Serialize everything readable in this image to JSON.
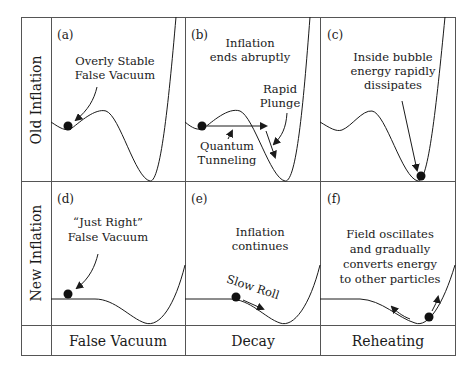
{
  "figure": {
    "rows": [
      {
        "label": "Old Inflation"
      },
      {
        "label": "New Inflation"
      }
    ],
    "columns": [
      {
        "label": "False Vacuum"
      },
      {
        "label": "Decay"
      },
      {
        "label": "Reheating"
      }
    ],
    "panels": {
      "a": {
        "tag": "(a)",
        "lines": [
          "Overly Stable",
          "False Vacuum"
        ]
      },
      "b": {
        "tag": "(b)",
        "lines": [
          "Inflation",
          "ends abruptly"
        ],
        "label_plunge": [
          "Rapid",
          "Plunge"
        ],
        "label_tunnel": [
          "Quantum",
          "Tunneling"
        ]
      },
      "c": {
        "tag": "(c)",
        "lines": [
          "Inside bubble",
          "energy rapidly",
          "dissipates"
        ]
      },
      "d": {
        "tag": "(d)",
        "lines": [
          "“Just Right”",
          "False Vacuum"
        ]
      },
      "e": {
        "tag": "(e)",
        "lines": [
          "Inflation",
          "continues"
        ],
        "label_roll": "Slow Roll"
      },
      "f": {
        "tag": "(f)",
        "lines": [
          "Field oscillates",
          "and gradually",
          "converts energy",
          "to other particles"
        ]
      }
    },
    "colors": {
      "line": "#1a1a1a",
      "grid": "#555555",
      "background": "#ffffff"
    }
  }
}
